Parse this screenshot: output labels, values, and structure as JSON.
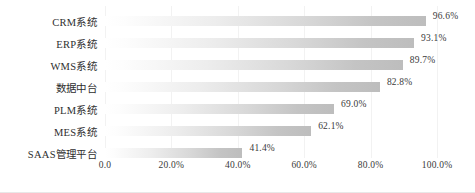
{
  "chart_data": {
    "type": "bar",
    "orientation": "horizontal",
    "title": "",
    "subtitle": "",
    "xlabel": "",
    "ylabel": "",
    "xlim": [
      0,
      100
    ],
    "grid": true,
    "legend": false,
    "legend_position": "none",
    "categories": [
      "CRM系统",
      "ERP系统",
      "WMS系统",
      "数据中台",
      "PLM系统",
      "MES系统",
      "SAAS管理平台"
    ],
    "values": [
      96.6,
      93.1,
      89.7,
      82.8,
      69.0,
      62.1,
      41.4
    ],
    "value_labels": [
      "96.6%",
      "93.1%",
      "89.7%",
      "82.8%",
      "69.0%",
      "62.1%",
      "41.4%"
    ],
    "xticks": [
      0,
      20,
      40,
      60,
      80,
      100
    ],
    "xtick_labels": [
      "0.0",
      "20.0%",
      "40.0%",
      "60.0%",
      "80.0%",
      "100.0%"
    ],
    "bar_gradient_start": "#ffffff",
    "bar_gradient_end": "#bdbdbd",
    "gridline_color": "#f2f2f2",
    "text_color": "#3a3a3a"
  }
}
